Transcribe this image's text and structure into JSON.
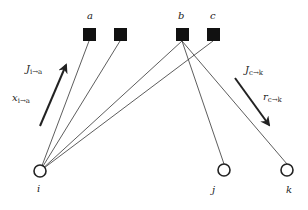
{
  "factor_nodes": [
    {
      "id": "a",
      "label": "a",
      "x": 89,
      "y": 35,
      "show_label": true
    },
    {
      "id": "f2",
      "label": "",
      "x": 120,
      "y": 35,
      "show_label": false
    },
    {
      "id": "b",
      "label": "b",
      "x": 182,
      "y": 35,
      "show_label": true
    },
    {
      "id": "c",
      "label": "c",
      "x": 213,
      "y": 35,
      "show_label": true
    }
  ],
  "variable_nodes": [
    {
      "id": "i",
      "label": "i",
      "x": 40,
      "y": 171
    },
    {
      "id": "j",
      "label": "j",
      "x": 224,
      "y": 170
    },
    {
      "id": "k",
      "label": "k",
      "x": 287,
      "y": 170
    }
  ],
  "edges": [
    {
      "from": "i",
      "to": "a"
    },
    {
      "from": "i",
      "to": "f2"
    },
    {
      "from": "i",
      "to": "b"
    },
    {
      "from": "i",
      "to": "c"
    },
    {
      "from": "b",
      "to": "j"
    },
    {
      "from": "b",
      "to": "k"
    }
  ],
  "messages": [
    {
      "id": "msg-i-to-a",
      "arrow": {
        "x1": 40,
        "y1": 126,
        "x2": 67,
        "y2": 63
      },
      "labels": [
        {
          "main": "J",
          "sub": "i→a",
          "x": 27,
          "y": 70
        },
        {
          "main": "x",
          "sub": "i→a",
          "x": 12,
          "y": 101
        }
      ]
    },
    {
      "id": "msg-c-to-k",
      "arrow": {
        "x1": 235,
        "y1": 78,
        "x2": 270,
        "y2": 127
      },
      "labels": [
        {
          "main": "J",
          "sub": "c→k",
          "x": 245,
          "y": 72
        },
        {
          "main": "r",
          "sub": "c→k",
          "x": 263,
          "y": 100
        }
      ]
    }
  ],
  "labels": {
    "a": "a",
    "b": "b",
    "c": "c",
    "i": "i",
    "j": "j",
    "k": "k",
    "J_i_a_main": "J",
    "J_i_a_sub": "i→a",
    "x_i_a_main": "x",
    "x_i_a_sub": "i→a",
    "J_c_k_main": "J",
    "J_c_k_sub": "c→k",
    "r_c_k_main": "r",
    "r_c_k_sub": "c→k"
  },
  "colors": {
    "stroke": "#222222",
    "factor_fill": "#111111",
    "background": "#ffffff"
  }
}
